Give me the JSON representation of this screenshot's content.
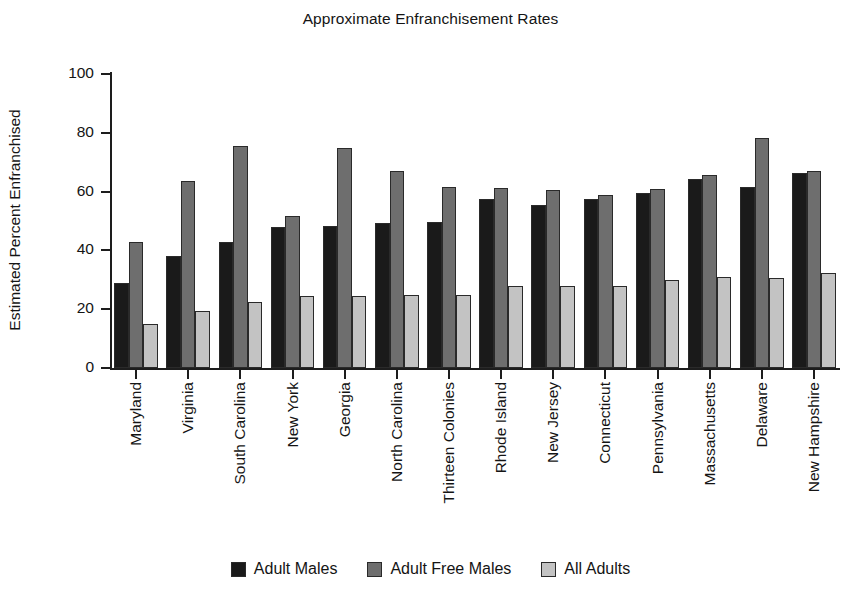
{
  "chart_data": {
    "type": "bar",
    "title": "Approximate Enfranchisement Rates",
    "xlabel": "",
    "ylabel": "Estimated Percent Enfranchised",
    "ylim": [
      0,
      100
    ],
    "yticks": [
      0,
      20,
      40,
      60,
      80,
      100
    ],
    "grid": false,
    "legend_position": "bottom",
    "categories": [
      "Maryland",
      "Virginia",
      "South Carolina",
      "New York",
      "Georgia",
      "North Carolina",
      "Thirteen Colonies",
      "Rhode Island",
      "New Jersey",
      "Connecticut",
      "Pennsylvania",
      "Massachusetts",
      "Delaware",
      "New Hampshire"
    ],
    "series": [
      {
        "name": "Adult Males",
        "color": "#1a1a1a",
        "values": [
          28.8,
          38.0,
          43.0,
          47.8,
          48.4,
          49.2,
          49.5,
          57.5,
          55.6,
          57.6,
          59.6,
          64.2,
          61.4,
          66.3
        ]
      },
      {
        "name": "Adult Free Males",
        "color": "#6e6e6e",
        "values": [
          43.0,
          63.7,
          75.4,
          51.8,
          74.8,
          67.0,
          61.4,
          61.2,
          60.6,
          58.7,
          60.8,
          65.5,
          78.2,
          67.0
        ]
      },
      {
        "name": "All Adults",
        "color": "#c3c3c3",
        "values": [
          14.9,
          19.3,
          22.4,
          24.6,
          24.6,
          24.8,
          24.8,
          28.0,
          28.0,
          27.8,
          29.9,
          31.0,
          30.7,
          32.3
        ]
      }
    ]
  },
  "legend": {
    "items": [
      {
        "label": "Adult Males"
      },
      {
        "label": "Adult Free Males"
      },
      {
        "label": "All Adults"
      }
    ]
  }
}
